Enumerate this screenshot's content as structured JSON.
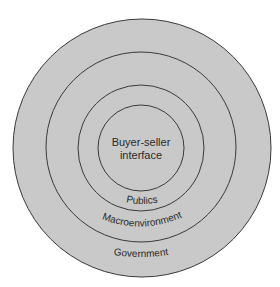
{
  "diagram": {
    "type": "concentric-circles",
    "colors": {
      "background": "#ffffff",
      "fill": "#c9c9c9",
      "stroke": "#3a3a3a",
      "text": "#2a2a2a"
    },
    "rings": [
      {
        "label_line1": "Buyer-seller",
        "label_line2": "interface"
      },
      {
        "label": "Publics"
      },
      {
        "label": "Macroenvironment"
      },
      {
        "label": "Government"
      }
    ]
  }
}
